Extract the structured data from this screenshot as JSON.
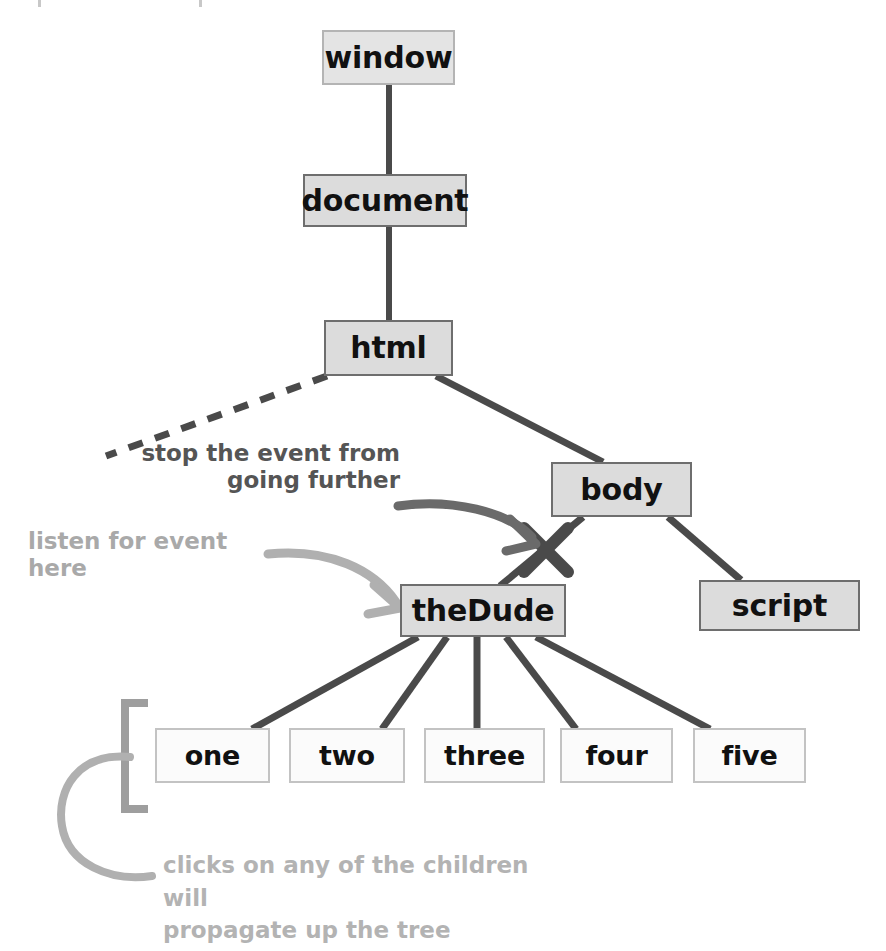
{
  "diagram": {
    "colors": {
      "node_fill": "#dcdcdc",
      "node_border": "#6e6e6e",
      "leaf_fill": "#fbfbfb",
      "leaf_border": "#c3c3c3",
      "edge": "#4a4a4a",
      "dark_annotation": "#555555",
      "light_annotation": "#a9a9a9",
      "bracket": "#9e9e9e",
      "background": "#ffffff"
    },
    "nodes": [
      {
        "id": "window",
        "label": "window"
      },
      {
        "id": "document",
        "label": "document"
      },
      {
        "id": "html",
        "label": "html"
      },
      {
        "id": "body",
        "label": "body"
      },
      {
        "id": "script",
        "label": "script"
      },
      {
        "id": "thedude",
        "label": "theDude"
      }
    ],
    "children": [
      {
        "id": "one",
        "label": "one"
      },
      {
        "id": "two",
        "label": "two"
      },
      {
        "id": "three",
        "label": "three"
      },
      {
        "id": "four",
        "label": "four"
      },
      {
        "id": "five",
        "label": "five"
      }
    ],
    "annotations": {
      "stop_event": "stop the event from\ngoing further",
      "listen_here": "listen for event here",
      "propagate": "clicks on any of the children will\npropagate up the tree"
    },
    "markers": {
      "blocked": "x-cross-marker"
    }
  }
}
